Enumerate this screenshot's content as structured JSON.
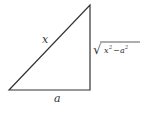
{
  "diagram": {
    "type": "right-triangle",
    "hypotenuse_label": "x",
    "base_label": "a",
    "vertical_side_label": {
      "radical": "√",
      "radicand_base1": "x",
      "exp1": "2",
      "operator": "−",
      "radicand_base2": "a",
      "exp2": "2",
      "full_text": "√(x² − a²)"
    },
    "colors": {
      "stroke": "#333333",
      "text": "#333333"
    }
  }
}
